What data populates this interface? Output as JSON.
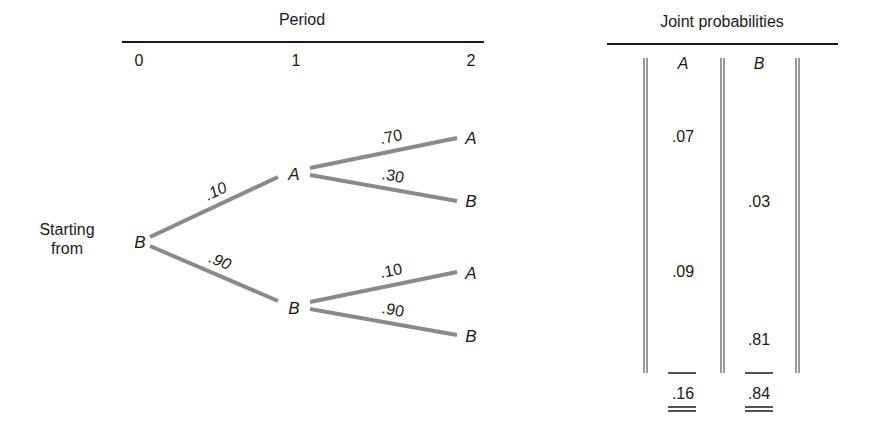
{
  "tree": {
    "header": "Period",
    "periods": [
      "0",
      "1",
      "2"
    ],
    "start_label_line1": "Starting",
    "start_label_line2": "from",
    "root": "B",
    "level1": [
      {
        "node": "A",
        "prob": ".10",
        "children": [
          {
            "node": "A",
            "prob": ".70"
          },
          {
            "node": "B",
            "prob": ".30"
          }
        ]
      },
      {
        "node": "B",
        "prob": ".90",
        "children": [
          {
            "node": "A",
            "prob": ".10"
          },
          {
            "node": "B",
            "prob": ".90"
          }
        ]
      }
    ]
  },
  "table": {
    "header": "Joint probabilities",
    "columns": [
      "A",
      "B"
    ],
    "rows": [
      {
        "A": ".07",
        "B": ""
      },
      {
        "A": "",
        "B": ".03"
      },
      {
        "A": ".09",
        "B": ""
      },
      {
        "A": "",
        "B": ".81"
      }
    ],
    "totals": {
      "A": ".16",
      "B": ".84"
    }
  },
  "colors": {
    "branch": "#8a8a8a",
    "text": "#1a1a1a",
    "rule": "#1a1a1a",
    "table_line": "#9a9a9a"
  }
}
